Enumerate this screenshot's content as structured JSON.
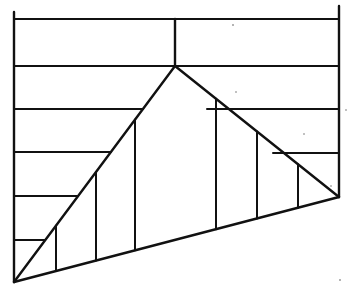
{
  "diagram": {
    "canvas": {
      "width": 350,
      "height": 287
    },
    "stroke_color": "#111111",
    "background": "#ffffff",
    "frame": {
      "left_edge": {
        "x": 14,
        "y1": 12,
        "y2": 282
      },
      "right_edge": {
        "x": 339,
        "y1": 6,
        "y2": 197
      },
      "top_line_y": 19,
      "center_post": {
        "x": 175,
        "y1": 19,
        "y2": 66
      }
    },
    "triangle": {
      "bottom_left": [
        14,
        282
      ],
      "apex": [
        175,
        66
      ],
      "bottom_right": [
        339,
        197
      ]
    },
    "horizontal_lines": [
      {
        "y": 19,
        "x1": 14,
        "x2": 339
      },
      {
        "y": 66,
        "x1": 14,
        "x2": 339
      },
      {
        "y": 109,
        "x1": 14,
        "x2": 143
      },
      {
        "y": 109,
        "x1": 207,
        "x2": 339
      },
      {
        "y": 152,
        "x1": 14,
        "x2": 111
      },
      {
        "y": 153,
        "x1": 273,
        "x2": 339
      },
      {
        "y": 196,
        "x1": 14,
        "x2": 78
      },
      {
        "y": 240,
        "x1": 14,
        "x2": 45
      }
    ],
    "vertical_hatch_x": [
      56,
      96,
      135,
      216,
      257,
      298
    ]
  }
}
